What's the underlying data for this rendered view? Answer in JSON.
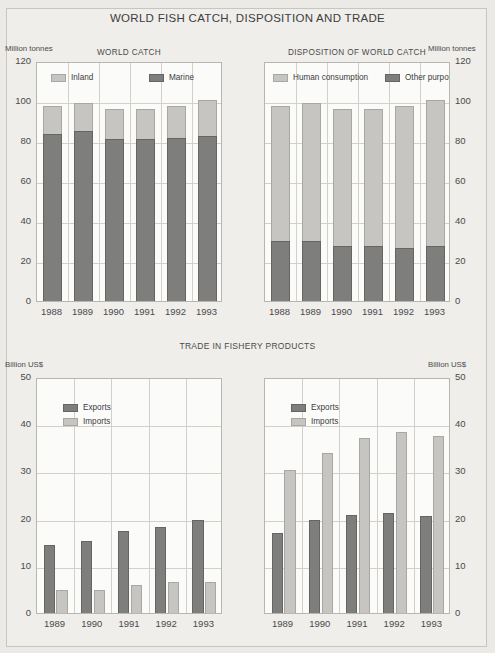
{
  "figure": {
    "title": "WORLD FISH CATCH, DISPOSITION AND TRADE",
    "mid_title": "TRADE IN FISHERY PRODUCTS",
    "corner_mark": "",
    "colors": {
      "light_series": "#c6c5c1",
      "dark_series": "#7e7e7c",
      "page_background": "#efeeeb",
      "plot_background": "#fbfbfa",
      "gridline": "#d3d0cc",
      "text": "#3d3d3d"
    }
  },
  "chart_data": [
    {
      "id": "world-catch",
      "type": "bar",
      "stacked": true,
      "title": "WORLD CATCH",
      "xlabel": "",
      "ylabel": "Million tonnes",
      "unit_label": "Million tonnes",
      "unit_side": "left",
      "ylim": [
        0,
        120
      ],
      "yticks": [
        0,
        20,
        40,
        60,
        80,
        100,
        120
      ],
      "grid": true,
      "legend_position": "top-left-inside",
      "categories": [
        "1988",
        "1989",
        "1990",
        "1991",
        "1992",
        "1993"
      ],
      "series": [
        {
          "name": "Marine",
          "color": "#7e7e7c",
          "values": [
            84.5,
            85.8,
            82.0,
            82.0,
            82.7,
            83.7
          ]
        },
        {
          "name": "Inland",
          "color": "#c6c5c1",
          "values": [
            14.0,
            14.2,
            15.0,
            15.0,
            15.8,
            17.8
          ]
        }
      ],
      "totals": [
        98.5,
        100.0,
        97.0,
        97.0,
        98.5,
        101.5
      ]
    },
    {
      "id": "disposition-of-world-catch",
      "type": "bar",
      "stacked": true,
      "title": "DISPOSITION OF WORLD CATCH",
      "xlabel": "",
      "ylabel": "Million tonnes",
      "unit_label": "Million tonnes",
      "unit_side": "right",
      "ylim": [
        0,
        120
      ],
      "yticks": [
        0,
        20,
        40,
        60,
        80,
        100,
        120
      ],
      "grid": true,
      "legend_position": "top-left-inside",
      "categories": [
        "1988",
        "1989",
        "1990",
        "1991",
        "1992",
        "1993"
      ],
      "series": [
        {
          "name": "Other purposes",
          "color": "#7e7e7c",
          "values": [
            31.0,
            31.0,
            28.5,
            28.5,
            27.5,
            28.5
          ]
        },
        {
          "name": "Human consumption",
          "color": "#c6c5c1",
          "values": [
            67.5,
            69.0,
            68.5,
            68.5,
            71.0,
            73.0
          ]
        }
      ],
      "totals": [
        98.5,
        100.0,
        97.0,
        97.0,
        98.5,
        101.5
      ]
    },
    {
      "id": "trade-developing-countries",
      "type": "bar",
      "stacked": false,
      "title": "DEVELOPING COUNTRIES",
      "xlabel": "",
      "ylabel": "Billion US$",
      "unit_label": "Billion US$",
      "unit_side": "left",
      "ylim": [
        0,
        50
      ],
      "yticks": [
        0,
        10,
        20,
        30,
        40,
        50
      ],
      "grid": true,
      "legend_position": "top-left-inside",
      "categories": [
        "1989",
        "1990",
        "1991",
        "1992",
        "1993"
      ],
      "series": [
        {
          "name": "Exports",
          "color": "#7e7e7c",
          "values": [
            14.9,
            15.7,
            17.7,
            18.7,
            20.2
          ]
        },
        {
          "name": "Imports",
          "color": "#c6c5c1",
          "values": [
            5.2,
            5.3,
            6.4,
            7.0,
            7.0
          ]
        }
      ]
    },
    {
      "id": "trade-developed-countries",
      "type": "bar",
      "stacked": false,
      "title": "DEVELOPED COUNTRIES",
      "xlabel": "",
      "ylabel": "Billion US$",
      "unit_label": "Billion US$",
      "unit_side": "right",
      "ylim": [
        0,
        50
      ],
      "yticks": [
        0,
        10,
        20,
        30,
        40,
        50
      ],
      "grid": true,
      "legend_position": "top-left-inside",
      "categories": [
        "1989",
        "1990",
        "1991",
        "1992",
        "1993"
      ],
      "series": [
        {
          "name": "Exports",
          "color": "#7e7e7c",
          "values": [
            17.3,
            20.2,
            21.2,
            21.7,
            21.0
          ]
        },
        {
          "name": "Imports",
          "color": "#c6c5c1",
          "values": [
            30.8,
            34.3,
            37.5,
            38.8,
            38.0
          ]
        }
      ]
    }
  ]
}
